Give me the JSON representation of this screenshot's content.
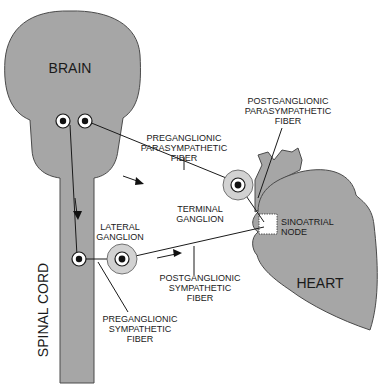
{
  "diagram": {
    "colors": {
      "organ_fill": "#a6a6a6",
      "ganglion_halo": "#d2d2d2",
      "line": "#1a1a1a",
      "background": "#ffffff"
    },
    "organs": {
      "brain": "BRAIN",
      "spinal_cord": "SPINAL CORD",
      "heart": "HEART"
    },
    "labels": {
      "preganglionic_parasympathetic": [
        "PREGANGLIONIC",
        "PARASYMPATHETIC",
        "FIBER"
      ],
      "postganglionic_parasympathetic": [
        "POSTGANGLIONIC",
        "PARASYMPATHETIC",
        "FIBER"
      ],
      "terminal_ganglion": [
        "TERMINAL",
        "GANGLION"
      ],
      "sinoatrial_node": [
        "SINOATRIAL",
        "NODE"
      ],
      "lateral_ganglion": [
        "LATERAL",
        "GANGLION"
      ],
      "postganglionic_sympathetic": [
        "POSTGANGLIONIC",
        "SYMPATHETIC",
        "FIBER"
      ],
      "preganglionic_sympathetic": [
        "PREGANGLIONIC",
        "SYMPATHETIC",
        "FIBER"
      ]
    },
    "icons": {
      "direction_arrow": "arrow-icon",
      "neuron_cell_body": "neuron-icon"
    }
  }
}
